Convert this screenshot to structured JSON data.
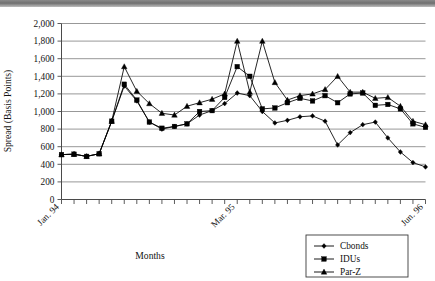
{
  "chart_data": {
    "type": "line",
    "title": "",
    "xlabel": "Months",
    "ylabel": "Spread (Basis Points)",
    "ylim": [
      0,
      2000
    ],
    "ytick_step": 200,
    "ytick_labels": [
      "0",
      "200",
      "400",
      "600",
      "800",
      "1,000",
      "1,200",
      "1,400",
      "1,600",
      "1,800",
      "2,000"
    ],
    "ytick_values": [
      0,
      200,
      400,
      600,
      800,
      1000,
      1200,
      1400,
      1600,
      1800,
      2000
    ],
    "grid": true,
    "grid_axis": "y",
    "legend_position": "bottom-right",
    "x_count": 30,
    "xtick_labels": [
      "Jan. 94",
      "Mar. 95",
      "Jun. 96"
    ],
    "xtick_label_indices": [
      0,
      14,
      29
    ],
    "x_tick_rotation": -45,
    "series": [
      {
        "name": "Cbonds",
        "marker": "diamond",
        "values": [
          510,
          515,
          490,
          520,
          890,
          1290,
          1120,
          880,
          800,
          830,
          860,
          960,
          1010,
          1090,
          1210,
          1180,
          1000,
          870,
          900,
          940,
          950,
          890,
          620,
          760,
          850,
          880,
          700,
          540,
          420,
          370
        ]
      },
      {
        "name": "IDUs",
        "marker": "square",
        "values": [
          510,
          515,
          490,
          520,
          890,
          1310,
          1130,
          880,
          810,
          830,
          860,
          1000,
          1010,
          1160,
          1510,
          1400,
          1030,
          1040,
          1100,
          1150,
          1120,
          1180,
          1100,
          1200,
          1210,
          1070,
          1080,
          1030,
          860,
          820
        ]
      },
      {
        "name": "Par-Z",
        "marker": "triangle",
        "values": [
          510,
          515,
          490,
          520,
          890,
          1510,
          1230,
          1090,
          980,
          960,
          1060,
          1100,
          1140,
          1200,
          1800,
          1220,
          1800,
          1330,
          1130,
          1180,
          1200,
          1250,
          1400,
          1220,
          1220,
          1150,
          1160,
          1060,
          890,
          850
        ]
      }
    ]
  },
  "legend": {
    "items": [
      {
        "label": "Cbonds"
      },
      {
        "label": "IDUs"
      },
      {
        "label": "Par-Z"
      }
    ]
  },
  "axes": {
    "y_title": "Spread (Basis Points)",
    "x_title": "Months"
  }
}
